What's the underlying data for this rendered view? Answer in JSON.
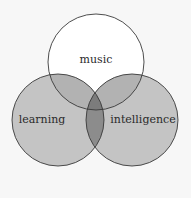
{
  "diagram": {
    "type": "venn",
    "background": "#f7f7f7",
    "stroke_color": "#3a3a3a",
    "sets": [
      {
        "id": "music",
        "label": "music",
        "fill": "#ffffff",
        "cx": 96,
        "cy": 62,
        "r": 48
      },
      {
        "id": "learning",
        "label": "learning",
        "fill": "#c4c4c4",
        "cx": 58,
        "cy": 120,
        "r": 46
      },
      {
        "id": "intelligence",
        "label": "intelligence",
        "fill": "#c4c4c4",
        "cx": 132,
        "cy": 120,
        "r": 46
      }
    ],
    "overlap_colors": {
      "music_learning": "#b2b2b2",
      "music_intelligence": "#b2b2b2",
      "learning_intelligence": "#8c8c8c",
      "all_three": "#7c7c7c"
    }
  }
}
